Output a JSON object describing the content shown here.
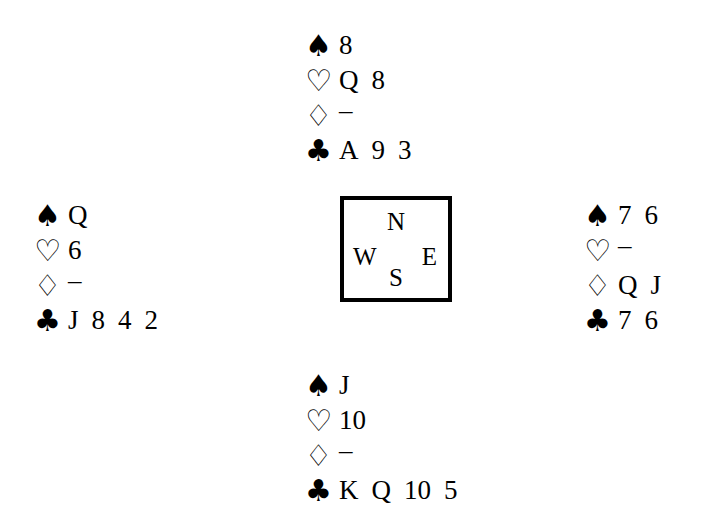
{
  "deal": {
    "suit_glyphs": {
      "spades": "♠",
      "hearts": "♡",
      "diamonds": "♢",
      "clubs": "♣"
    },
    "void_mark": "–",
    "hands": {
      "north": {
        "label": "North",
        "suits": [
          {
            "suit": "spades",
            "glyph": "♠",
            "style": "filled",
            "cards": [
              "8"
            ]
          },
          {
            "suit": "hearts",
            "glyph": "♡",
            "style": "hollow",
            "cards": [
              "Q",
              "8"
            ]
          },
          {
            "suit": "diamonds",
            "glyph": "♢",
            "style": "hollow",
            "cards": [
              "–"
            ]
          },
          {
            "suit": "clubs",
            "glyph": "♣",
            "style": "filled",
            "cards": [
              "A",
              "9",
              "3"
            ]
          }
        ]
      },
      "west": {
        "label": "West",
        "suits": [
          {
            "suit": "spades",
            "glyph": "♠",
            "style": "filled",
            "cards": [
              "Q"
            ]
          },
          {
            "suit": "hearts",
            "glyph": "♡",
            "style": "hollow",
            "cards": [
              "6"
            ]
          },
          {
            "suit": "diamonds",
            "glyph": "♢",
            "style": "hollow",
            "cards": [
              "–"
            ]
          },
          {
            "suit": "clubs",
            "glyph": "♣",
            "style": "filled",
            "cards": [
              "J",
              "8",
              "4",
              "2"
            ]
          }
        ]
      },
      "east": {
        "label": "East",
        "suits": [
          {
            "suit": "spades",
            "glyph": "♠",
            "style": "filled",
            "cards": [
              "7",
              "6"
            ]
          },
          {
            "suit": "hearts",
            "glyph": "♡",
            "style": "hollow",
            "cards": [
              "–"
            ]
          },
          {
            "suit": "diamonds",
            "glyph": "♢",
            "style": "hollow",
            "cards": [
              "Q",
              "J"
            ]
          },
          {
            "suit": "clubs",
            "glyph": "♣",
            "style": "filled",
            "cards": [
              "7",
              "6"
            ]
          }
        ]
      },
      "south": {
        "label": "South",
        "suits": [
          {
            "suit": "spades",
            "glyph": "♠",
            "style": "filled",
            "cards": [
              "J"
            ]
          },
          {
            "suit": "hearts",
            "glyph": "♡",
            "style": "hollow",
            "cards": [
              "10"
            ]
          },
          {
            "suit": "diamonds",
            "glyph": "♢",
            "style": "hollow",
            "cards": [
              "–"
            ]
          },
          {
            "suit": "clubs",
            "glyph": "♣",
            "style": "filled",
            "cards": [
              "K",
              "Q",
              "10",
              "5"
            ]
          }
        ]
      }
    },
    "compass": {
      "north": "N",
      "east": "E",
      "south": "S",
      "west": "W"
    },
    "colors": {
      "ink": "#000000",
      "background": "#ffffff"
    }
  }
}
